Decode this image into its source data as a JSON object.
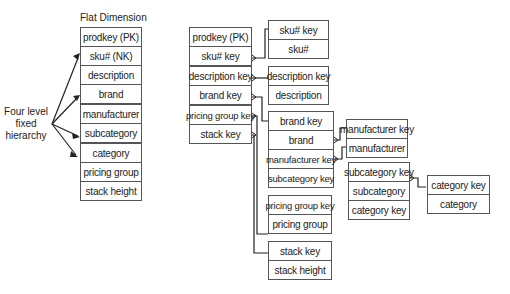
{
  "flat": {
    "title": "Flat Dimension",
    "rows": [
      "prodkey (PK)",
      "sku# (NK)",
      "description",
      "brand",
      "manufacturer",
      "subcategory",
      "category",
      "pricing group",
      "stack height"
    ]
  },
  "hierarchy_label": "Four level\nfixed\nhierarchy",
  "snowflake": {
    "product": [
      "prodkey (PK)",
      "sku# key",
      "description key",
      "brand key",
      "pricing group key",
      "stack key"
    ],
    "sku": [
      "sku# key",
      "sku#"
    ],
    "description": [
      "description key",
      "description"
    ],
    "brand": [
      "brand key",
      "brand",
      "manufacturer key",
      "subcategory key"
    ],
    "pricing": [
      "pricing group key",
      "pricing group"
    ],
    "stack": [
      "stack key",
      "stack height"
    ],
    "manufacturer": [
      "manufacturer key",
      "manufacturer"
    ],
    "subcategory": [
      "subcategory key",
      "subcategory",
      "category key"
    ],
    "category": [
      "category key",
      "category"
    ]
  }
}
